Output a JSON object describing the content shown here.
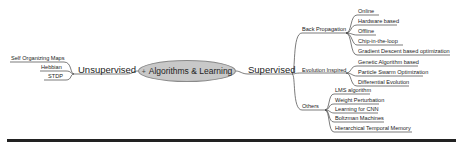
{
  "root": {
    "label": "Algorithms & Learning",
    "marker": "+"
  },
  "left": {
    "label": "Unsupervised",
    "children": [
      "Self Organizing Maps",
      "Hebbian",
      "STDP"
    ]
  },
  "right": {
    "label": "Supervised",
    "groups": [
      {
        "label": "Back Propagation",
        "children": [
          "Online",
          "Hardware based",
          "Offline",
          "Chip-in-the-loop",
          "Gradient Descent based optimization"
        ]
      },
      {
        "label": "Evolution Inspired",
        "children": [
          "Genetic Algorithm based",
          "Particle Swarm Optimization",
          "Differential Evolution"
        ]
      },
      {
        "label": "Others",
        "children": [
          "LMS algorithm",
          "Weight Perturbation",
          "Learning for CNN",
          "Boltzman Machines",
          "Hierarchical Temporal Memory"
        ]
      }
    ]
  },
  "colors": {
    "node_fill": "#c8c8c8",
    "line": "#333333"
  }
}
